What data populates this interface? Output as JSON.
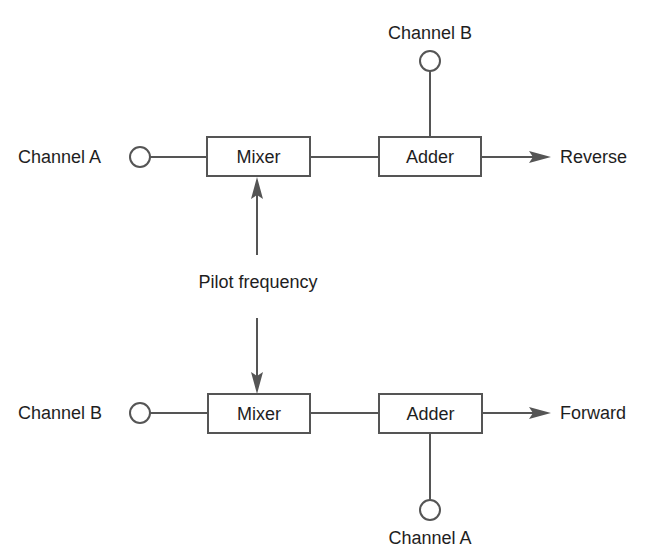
{
  "diagram": {
    "type": "block-diagram",
    "colors": {
      "stroke": "#555555",
      "text": "#1e1e1e",
      "background": "#ffffff"
    },
    "reverse_path": {
      "input_label": "Channel A",
      "mixer_label": "Mixer",
      "adder_label": "Adder",
      "adder_input_label": "Channel B",
      "output_label": "Reverse"
    },
    "pilot": {
      "label": "Pilot frequency"
    },
    "forward_path": {
      "input_label": "Channel B",
      "mixer_label": "Mixer",
      "adder_label": "Adder",
      "adder_input_label": "Channel A",
      "output_label": "Forward"
    }
  }
}
